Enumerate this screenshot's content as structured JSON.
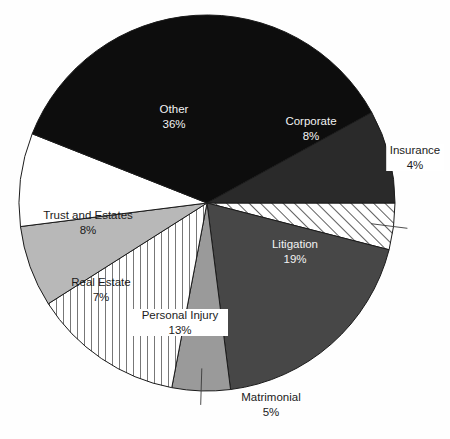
{
  "figure": {
    "title": "",
    "background_color": "#fefefe"
  },
  "chart_data": {
    "type": "pie",
    "title": "",
    "categories": [
      "Other",
      "Corporate",
      "Insurance",
      "Litigation",
      "Matrimonial",
      "Personal Injury",
      "Real Estate",
      "Trust and Estates"
    ],
    "values": [
      36,
      8,
      4,
      19,
      5,
      13,
      7,
      8
    ],
    "value_unit": "%",
    "legend": "none",
    "labels_inside": true,
    "slices": [
      {
        "name": "Other",
        "label": "Other",
        "value": 36,
        "value_label": "36%",
        "fill": "#0d0d0d",
        "pattern": "solid",
        "text_color": "#f2f2f2",
        "label_x": 174,
        "label_y": 116,
        "leader": false
      },
      {
        "name": "Corporate",
        "label": "Corporate",
        "value": 8,
        "value_label": "8%",
        "fill": "#2a2a2a",
        "pattern": "solid",
        "text_color": "#f2f2f2",
        "label_x": 311,
        "label_y": 128,
        "leader": false
      },
      {
        "name": "Insurance",
        "label": "Insurance",
        "value": 4,
        "value_label": "4%",
        "fill": "#ffffff",
        "pattern": "diagonal-hatch",
        "text_color": "#1b1b1b",
        "label_x": 415,
        "label_y": 157,
        "leader": true
      },
      {
        "name": "Litigation",
        "label": "Litigation",
        "value": 19,
        "value_label": "19%",
        "fill": "#474747",
        "pattern": "solid",
        "text_color": "#f2f2f2",
        "label_x": 295,
        "label_y": 251,
        "leader": false
      },
      {
        "name": "Matrimonial",
        "label": "Matrimonial",
        "value": 5,
        "value_label": "5%",
        "fill": "#9a9a9a",
        "pattern": "solid",
        "text_color": "#1b1b1b",
        "label_x": 271,
        "label_y": 404,
        "leader": true
      },
      {
        "name": "Personal Injury",
        "label": "Personal Injury",
        "value": 13,
        "value_label": "13%",
        "fill": "#ffffff",
        "pattern": "vertical-hatch",
        "text_color": "#1b1b1b",
        "label_x": 180,
        "label_y": 322,
        "leader": false
      },
      {
        "name": "Real Estate",
        "label": "Real Estate",
        "value": 7,
        "value_label": "7%",
        "fill": "#b8b8b8",
        "pattern": "solid",
        "text_color": "#1b1b1b",
        "label_x": 101,
        "label_y": 289,
        "leader": false
      },
      {
        "name": "Trust and Estates",
        "label": "Trust and Estates",
        "value": 8,
        "value_label": "8%",
        "fill": "#ffffff",
        "pattern": "solid",
        "text_color": "#1b1b1b",
        "label_x": 88,
        "label_y": 222,
        "leader": false
      }
    ],
    "geometry": {
      "center_x": 207,
      "center_y": 203,
      "radius": 188,
      "start_angle_deg": 0,
      "direction": "clockwise"
    }
  }
}
